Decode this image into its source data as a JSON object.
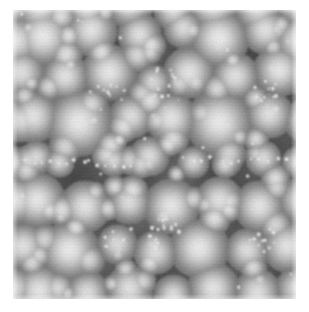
{
  "image": {
    "kind": "grayscale-micrograph",
    "description": "Densely packed spherical particles with bright centers and dark interstitial boundaries",
    "canvas_width": 309,
    "canvas_height": 312,
    "background_color": "#ffffff",
    "frame": {
      "x": 13,
      "y": 10,
      "width": 283,
      "height": 289
    },
    "palette": {
      "darkest": "#323232",
      "mid": "#8c8c8c",
      "brightest": "#f2f2f2",
      "background": "#ffffff"
    },
    "render": {
      "base_level": 118,
      "noise_amplitude": 7,
      "scanline_amplitude": 4,
      "blur_px": 0.6,
      "tile_period": 142
    },
    "particles": [
      {
        "x": 30,
        "y": 26,
        "r": 30,
        "i": 1.0
      },
      {
        "x": 78,
        "y": 20,
        "r": 26,
        "i": 0.95
      },
      {
        "x": 126,
        "y": 24,
        "r": 22,
        "i": 0.92
      },
      {
        "x": 170,
        "y": 18,
        "r": 20,
        "i": 0.88
      },
      {
        "x": 206,
        "y": 28,
        "r": 30,
        "i": 1.0
      },
      {
        "x": 252,
        "y": 20,
        "r": 24,
        "i": 0.93
      },
      {
        "x": 286,
        "y": 30,
        "r": 26,
        "i": 0.96
      },
      {
        "x": 8,
        "y": 62,
        "r": 24,
        "i": 0.92
      },
      {
        "x": 52,
        "y": 66,
        "r": 24,
        "i": 0.94
      },
      {
        "x": 96,
        "y": 62,
        "r": 28,
        "i": 0.98
      },
      {
        "x": 140,
        "y": 72,
        "r": 18,
        "i": 0.85
      },
      {
        "x": 176,
        "y": 62,
        "r": 26,
        "i": 0.96
      },
      {
        "x": 222,
        "y": 66,
        "r": 24,
        "i": 0.93
      },
      {
        "x": 266,
        "y": 60,
        "r": 26,
        "i": 0.97
      },
      {
        "x": 20,
        "y": 106,
        "r": 26,
        "i": 0.95
      },
      {
        "x": 66,
        "y": 112,
        "r": 34,
        "i": 1.0
      },
      {
        "x": 118,
        "y": 106,
        "r": 22,
        "i": 0.9
      },
      {
        "x": 158,
        "y": 108,
        "r": 26,
        "i": 0.96
      },
      {
        "x": 206,
        "y": 112,
        "r": 34,
        "i": 1.0
      },
      {
        "x": 256,
        "y": 104,
        "r": 24,
        "i": 0.93
      },
      {
        "x": 292,
        "y": 110,
        "r": 22,
        "i": 0.9
      },
      {
        "x": 16,
        "y": 150,
        "r": 16,
        "i": 0.86
      },
      {
        "x": 46,
        "y": 152,
        "r": 15,
        "i": 0.84
      },
      {
        "x": 100,
        "y": 150,
        "r": 16,
        "i": 0.85
      },
      {
        "x": 136,
        "y": 146,
        "r": 20,
        "i": 0.9
      },
      {
        "x": 180,
        "y": 152,
        "r": 16,
        "i": 0.86
      },
      {
        "x": 214,
        "y": 150,
        "r": 15,
        "i": 0.84
      },
      {
        "x": 250,
        "y": 148,
        "r": 18,
        "i": 0.88
      },
      {
        "x": 284,
        "y": 152,
        "r": 16,
        "i": 0.85
      },
      {
        "x": 24,
        "y": 190,
        "r": 28,
        "i": 0.98
      },
      {
        "x": 72,
        "y": 196,
        "r": 26,
        "i": 0.95
      },
      {
        "x": 116,
        "y": 192,
        "r": 22,
        "i": 0.9
      },
      {
        "x": 158,
        "y": 196,
        "r": 28,
        "i": 0.98
      },
      {
        "x": 206,
        "y": 190,
        "r": 24,
        "i": 0.93
      },
      {
        "x": 246,
        "y": 196,
        "r": 26,
        "i": 0.96
      },
      {
        "x": 288,
        "y": 190,
        "r": 24,
        "i": 0.92
      },
      {
        "x": 10,
        "y": 236,
        "r": 24,
        "i": 0.93
      },
      {
        "x": 56,
        "y": 240,
        "r": 30,
        "i": 1.0
      },
      {
        "x": 104,
        "y": 234,
        "r": 20,
        "i": 0.88
      },
      {
        "x": 142,
        "y": 242,
        "r": 22,
        "i": 0.91
      },
      {
        "x": 186,
        "y": 238,
        "r": 30,
        "i": 1.0
      },
      {
        "x": 234,
        "y": 240,
        "r": 22,
        "i": 0.9
      },
      {
        "x": 274,
        "y": 236,
        "r": 26,
        "i": 0.95
      },
      {
        "x": 26,
        "y": 280,
        "r": 26,
        "i": 0.96
      },
      {
        "x": 74,
        "y": 282,
        "r": 22,
        "i": 0.9
      },
      {
        "x": 116,
        "y": 278,
        "r": 24,
        "i": 0.93
      },
      {
        "x": 160,
        "y": 284,
        "r": 20,
        "i": 0.88
      },
      {
        "x": 200,
        "y": 278,
        "r": 26,
        "i": 0.96
      },
      {
        "x": 244,
        "y": 282,
        "r": 24,
        "i": 0.92
      },
      {
        "x": 284,
        "y": 278,
        "r": 22,
        "i": 0.9
      }
    ],
    "nanoparticle_clusters": [
      {
        "cx": 148,
        "cy": 72,
        "count": 16,
        "spread": 16,
        "r": 3.0
      },
      {
        "cx": 252,
        "cy": 78,
        "count": 12,
        "spread": 14,
        "r": 2.8
      },
      {
        "cx": 150,
        "cy": 224,
        "count": 16,
        "spread": 16,
        "r": 3.0
      },
      {
        "cx": 250,
        "cy": 228,
        "count": 12,
        "spread": 14,
        "r": 2.8
      },
      {
        "cx": 100,
        "cy": 82,
        "count": 8,
        "spread": 12,
        "r": 2.6
      },
      {
        "cx": 100,
        "cy": 232,
        "count": 8,
        "spread": 12,
        "r": 2.6
      }
    ],
    "nanoparticle_chains": [
      {
        "x1": 14,
        "y1": 150,
        "x2": 118,
        "y2": 154,
        "count": 14,
        "r": 3.2
      },
      {
        "x1": 170,
        "y1": 150,
        "x2": 290,
        "y2": 150,
        "count": 14,
        "r": 3.2
      },
      {
        "x1": 20,
        "y1": 296,
        "x2": 140,
        "y2": 298,
        "count": 12,
        "r": 3.0
      },
      {
        "x1": 170,
        "y1": 298,
        "x2": 286,
        "y2": 296,
        "count": 12,
        "r": 3.0
      }
    ]
  }
}
